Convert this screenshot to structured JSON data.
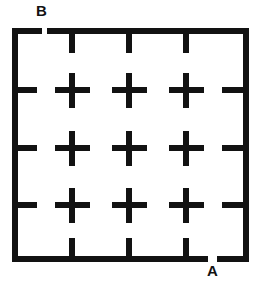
{
  "figure": {
    "kind": "maze-grid-diagram",
    "width": 255,
    "height": 287,
    "background_color": "#ffffff",
    "ink_color": "#121212",
    "stroke_width": 6
  },
  "border": {
    "left": 12,
    "top": 28,
    "right": 249,
    "bottom": 262,
    "thickness": 6
  },
  "openings": [
    {
      "id": "opening-b",
      "wall": "top",
      "label": "B",
      "start": 40,
      "end": 48
    },
    {
      "id": "opening-a",
      "wall": "bottom",
      "label": "A",
      "start": 207,
      "end": 217
    }
  ],
  "labels": {
    "entrance": "B",
    "exit": "A"
  },
  "grid": {
    "columns_x": [
      72,
      129,
      186
    ],
    "rows_y": [
      90,
      148,
      205
    ],
    "cross_arm_length": 17,
    "cells": 4
  },
  "crosses": [
    {
      "x": 72,
      "y": 90
    },
    {
      "x": 129,
      "y": 90
    },
    {
      "x": 186,
      "y": 90
    },
    {
      "x": 72,
      "y": 148
    },
    {
      "x": 129,
      "y": 148
    },
    {
      "x": 186,
      "y": 148
    },
    {
      "x": 72,
      "y": 205
    },
    {
      "x": 129,
      "y": 205
    },
    {
      "x": 186,
      "y": 205
    }
  ],
  "wall_stubs": {
    "top_stubs": [
      {
        "x": 72,
        "from_y": 31,
        "to_y": 52
      },
      {
        "x": 129,
        "from_y": 31,
        "to_y": 52
      },
      {
        "x": 186,
        "from_y": 31,
        "to_y": 52
      }
    ],
    "bottom_stubs": [
      {
        "x": 72,
        "from_y": 240,
        "to_y": 262
      },
      {
        "x": 129,
        "from_y": 240,
        "to_y": 262
      },
      {
        "x": 186,
        "from_y": 240,
        "to_y": 262
      }
    ],
    "left_stubs": [
      {
        "y": 90,
        "from_x": 14,
        "to_x": 36
      },
      {
        "y": 148,
        "from_x": 14,
        "to_x": 36
      },
      {
        "y": 205,
        "from_x": 14,
        "to_x": 36
      }
    ],
    "right_stubs": [
      {
        "y": 90,
        "from_x": 222,
        "to_x": 247
      },
      {
        "y": 148,
        "from_x": 222,
        "to_x": 247
      },
      {
        "y": 205,
        "from_x": 222,
        "to_x": 247
      }
    ]
  }
}
